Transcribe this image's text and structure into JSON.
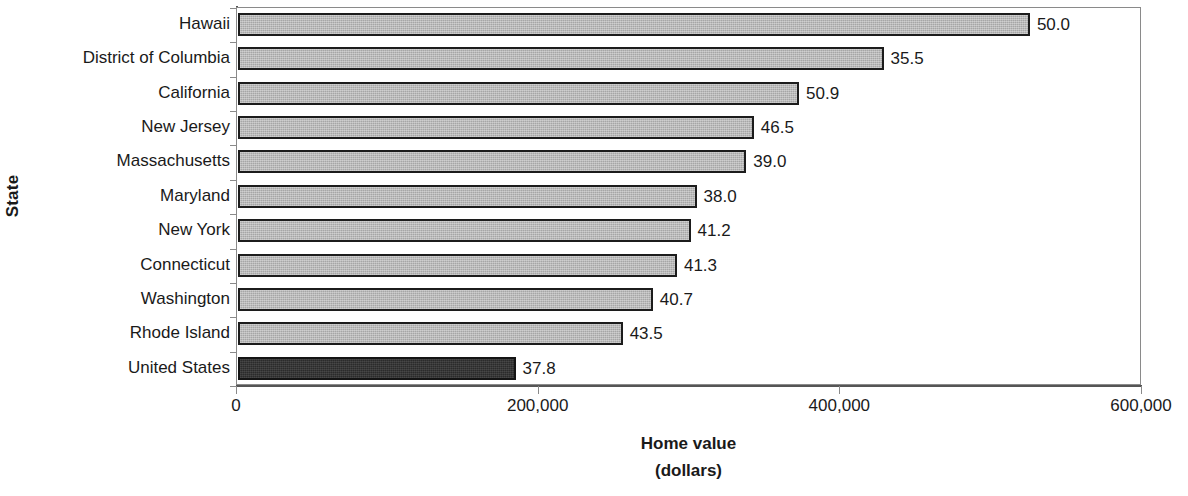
{
  "chart_data": {
    "type": "bar",
    "orientation": "horizontal",
    "title": "",
    "xlabel": "Home value",
    "xlabel_line2": "(dollars)",
    "ylabel": "State",
    "xlim": [
      0,
      600000
    ],
    "x_ticks": [
      0,
      200000,
      400000,
      600000
    ],
    "x_tick_labels": [
      "0",
      "200,000",
      "400,000",
      "600,000"
    ],
    "grid": false,
    "legend": "none",
    "categories": [
      "Hawaii",
      "District of Columbia",
      "California",
      "New Jersey",
      "Massachusetts",
      "Maryland",
      "New York",
      "Connecticut",
      "Washington",
      "Rhode Island",
      "United States"
    ],
    "values": [
      525000,
      428000,
      372000,
      342000,
      337000,
      304000,
      300000,
      291000,
      275000,
      255000,
      184000
    ],
    "point_labels": [
      "50.0",
      "35.5",
      "50.9",
      "46.5",
      "39.0",
      "38.0",
      "41.2",
      "41.3",
      "40.7",
      "43.5",
      "37.8"
    ],
    "highlight_index": 10,
    "colors": {
      "bar_fill": "#a6a6a6",
      "bar_edge": "#1c1c1c",
      "highlight_fill": "#2b2b2b",
      "axis": "#555555",
      "text": "#1a1a1a",
      "background": "#ffffff"
    }
  }
}
